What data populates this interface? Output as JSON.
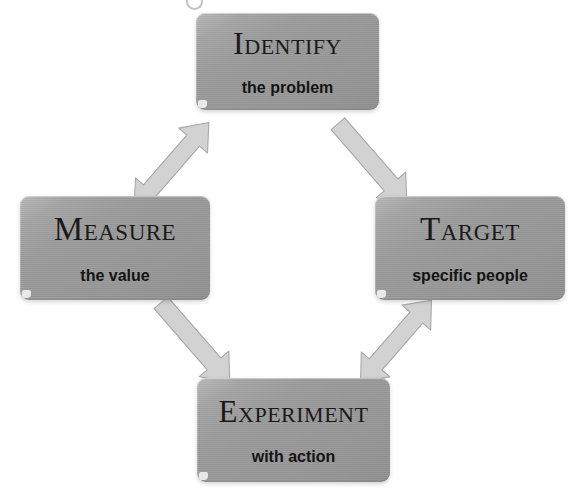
{
  "diagram": {
    "background_color": "#ffffff",
    "node_color": "#9a9a9a",
    "arrow_color": "#d2d2d2",
    "arrow_outline_color": "#a8a8a8",
    "text_color": "#141414",
    "nodes": [
      {
        "id": "identify",
        "title": "Identify",
        "subtitle": "the problem",
        "position": "top"
      },
      {
        "id": "measure",
        "title": "Measure",
        "subtitle": "the value",
        "position": "left"
      },
      {
        "id": "target",
        "title": "Target",
        "subtitle": "specific people",
        "position": "right"
      },
      {
        "id": "experiment",
        "title": "Experiment",
        "subtitle": "with action",
        "position": "bottom"
      }
    ],
    "connectors": [
      {
        "id": "measure-identify",
        "from": "measure",
        "to": "identify",
        "style": "double-headed",
        "direction": "up-right"
      },
      {
        "id": "identify-target",
        "from": "identify",
        "to": "target",
        "style": "single-headed",
        "direction": "down-right"
      },
      {
        "id": "measure-experiment",
        "from": "measure",
        "to": "experiment",
        "style": "single-headed",
        "direction": "down-right"
      },
      {
        "id": "experiment-target",
        "from": "experiment",
        "to": "target",
        "style": "double-headed",
        "direction": "up-right"
      }
    ]
  }
}
